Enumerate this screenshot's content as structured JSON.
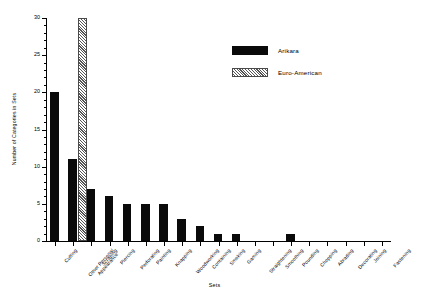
{
  "chart_data": {
    "type": "bar",
    "title": "",
    "xlabel": "Sets",
    "ylabel": "Number of Categories in Sets",
    "ylim": [
      0,
      30
    ],
    "ytick_labels": [
      "0",
      "5",
      "10",
      "15",
      "20",
      "25",
      "30"
    ],
    "ytick_values": [
      0,
      5,
      10,
      15,
      20,
      25,
      30
    ],
    "y_minor_step": 1,
    "grid": false,
    "legend_position": "upper right",
    "categories": [
      "Cutting",
      "Other Personal Appearance",
      "Scraping",
      "Piercing",
      "Perforating",
      "Painting",
      "Knapping",
      "Woodworking",
      "Containing",
      "Smoking",
      "Gaming",
      "Straightening",
      "Smoothing",
      "Pounding",
      "Chopping",
      "Abrading",
      "Decorating",
      "Joining",
      "Fastening"
    ],
    "series": [
      {
        "name": "Arikara",
        "color": "#0a0a0a",
        "pattern": "solid",
        "values": [
          20,
          11,
          7,
          6,
          5,
          5,
          5,
          3,
          2,
          1,
          1,
          0,
          0,
          1,
          0,
          0,
          0,
          0,
          0
        ]
      },
      {
        "name": "Euro-American",
        "color": "#555555",
        "pattern": "diagonal-hatch",
        "values": [
          0,
          30,
          0,
          0,
          0,
          0,
          0,
          0,
          0,
          0,
          0,
          0,
          0,
          0,
          0,
          0,
          0,
          0,
          0
        ]
      }
    ]
  },
  "legend": {
    "items": [
      {
        "label": "Arikara",
        "style": "arikara"
      },
      {
        "label": "Euro-American",
        "style": "euro"
      }
    ]
  },
  "axes": {
    "x_title": "Sets",
    "y_title": "Number of Categories in Sets"
  }
}
